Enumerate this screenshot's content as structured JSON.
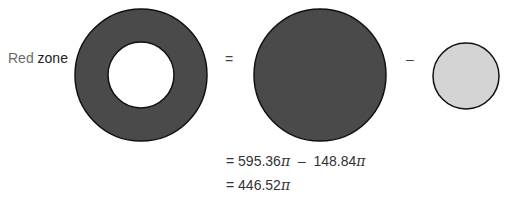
{
  "label": {
    "word1": "Red",
    "word2": "zone"
  },
  "operators": {
    "equals": "=",
    "minus": "–"
  },
  "shapes": {
    "ring": {
      "cx": 141,
      "cy": 75,
      "outer_r": 66,
      "inner_r": 33,
      "fill": "#4a4a4a",
      "hole_fill": "#ffffff"
    },
    "big_circle": {
      "cx": 320,
      "cy": 75,
      "r": 66,
      "fill": "#4a4a4a"
    },
    "small_circle": {
      "cx": 466,
      "cy": 76,
      "r": 33,
      "fill": "#d4d4d4"
    },
    "stroke": "#111111"
  },
  "equations": {
    "line1": {
      "prefix": "= ",
      "term1": "595.36",
      "pi1": "π",
      "op": "  –  ",
      "term2": "148.84",
      "pi2": "π"
    },
    "line2": {
      "prefix": "= ",
      "term1": "446.52",
      "pi1": "π"
    }
  }
}
